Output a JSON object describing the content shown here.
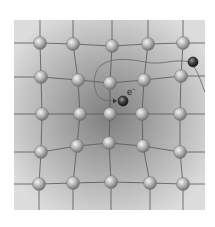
{
  "diagram": {
    "electron_label": "e",
    "electron_charge": "−",
    "lattice": {
      "rows": 5,
      "cols": 5,
      "atom_description": "positive ion (gray sphere)",
      "distortion": "lattice ions pulled toward the electron at center"
    },
    "colors": {
      "background_outer": "#d8d8d8",
      "background_center": "#8a8a8a",
      "bond_line": "#555555",
      "atom_fill": "#b8b8b8",
      "atom_highlight": "#f2f2f2",
      "atom_shadow": "#6e6e6e",
      "electron_fill": "#3a3a3a",
      "path_line": "#666666"
    },
    "elements": [
      {
        "kind": "electron",
        "role": "trapped electron near lattice center"
      },
      {
        "kind": "electron",
        "role": "incoming electron at upper right"
      },
      {
        "kind": "trajectory",
        "role": "electron path curving into the lattice"
      }
    ]
  }
}
